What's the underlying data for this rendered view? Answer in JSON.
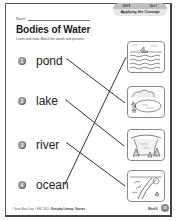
{
  "header": {
    "tab_left": "Skill 8",
    "tab_right": "Unit 1",
    "tab_label": "Applying the Concept",
    "name_label": "Name"
  },
  "title": "Bodies of Water",
  "instructions": "Listen and read. Match the words and pictures.",
  "items": [
    {
      "number": "1",
      "word": "pond",
      "matches_picture": 2
    },
    {
      "number": "2",
      "word": "lake",
      "matches_picture": 3
    },
    {
      "number": "3",
      "word": "river",
      "matches_picture": 4
    },
    {
      "number": "4",
      "word": "ocean",
      "matches_picture": 1
    }
  ],
  "pictures": [
    {
      "index": 1,
      "depicts": "ocean-with-boat"
    },
    {
      "index": 2,
      "depicts": "pond-with-plants"
    },
    {
      "index": 3,
      "depicts": "lake-with-trees"
    },
    {
      "index": 4,
      "depicts": "river-with-plants"
    }
  ],
  "footer": {
    "copyright": "© Evan-Moor Corp. • EMC 3031 •",
    "book": "Everyday Literacy: Science",
    "page_label": "Week 8",
    "page_number": "31"
  },
  "colors": {
    "ink": "#222222",
    "number_badge": "#9a9a9a",
    "tab_dark": "#bfbfbf",
    "tab_light": "#e6e6e6"
  }
}
